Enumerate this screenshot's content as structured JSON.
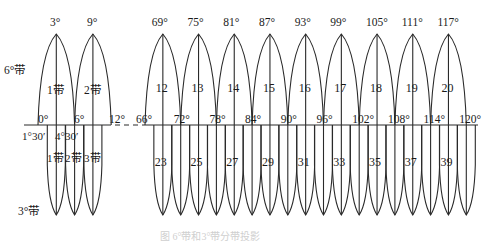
{
  "figure": {
    "caption": "图  6°带和3°带分带投影",
    "scale": {
      "px_per_degree": 6.0,
      "upper_apex_y": 34,
      "equator_y": 125,
      "lower_tip_y": 215
    }
  },
  "row_labels": {
    "six_degree": "6°带",
    "three_degree": "3°带"
  },
  "left_section": {
    "six_degree_zones": [
      {
        "zone": "1带",
        "central_meridian": "3°",
        "x": 56
      },
      {
        "zone": "2带",
        "central_meridian": "9°",
        "x": 93
      }
    ],
    "equator_ticks": [
      "0°",
      "6°",
      "12°"
    ],
    "three_degree_meridians": [
      "1°30′",
      "4°30′"
    ],
    "three_degree_zones": [
      "1带",
      "2带",
      "3带"
    ]
  },
  "right_section": {
    "six_degree_zones": [
      {
        "zone": "12",
        "central_meridian": "69°"
      },
      {
        "zone": "13",
        "central_meridian": "75°"
      },
      {
        "zone": "14",
        "central_meridian": "81°"
      },
      {
        "zone": "15",
        "central_meridian": "87°"
      },
      {
        "zone": "16",
        "central_meridian": "93°"
      },
      {
        "zone": "17",
        "central_meridian": "99°"
      },
      {
        "zone": "18",
        "central_meridian": "105°"
      },
      {
        "zone": "19",
        "central_meridian": "111°"
      },
      {
        "zone": "20",
        "central_meridian": "117°"
      }
    ],
    "equator_ticks": [
      "66°",
      "72°",
      "78°",
      "84°",
      "90°",
      "96°",
      "102°",
      "108°",
      "114°",
      "120°"
    ],
    "three_degree_zone_labels": [
      "23",
      "25",
      "27",
      "29",
      "31",
      "33",
      "35",
      "37",
      "39"
    ]
  }
}
